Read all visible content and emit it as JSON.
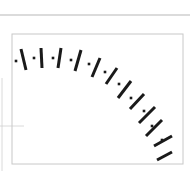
{
  "colors": {
    "background": "#ffffff",
    "tick": "#1a1a1a",
    "frame": "#c8c8c8",
    "top_rule": "#b8b8b8",
    "left_rule": "#d0d0d0"
  },
  "diagram": {
    "top_rule": {
      "x1": 0,
      "y1": 15,
      "x2": 190,
      "y2": 15
    },
    "frame": {
      "x": 12,
      "y": 34,
      "width": 171,
      "height": 130
    },
    "left_rules": [
      {
        "x1": 2,
        "y1": 78,
        "x2": 2,
        "y2": 171
      },
      {
        "x1": 0,
        "y1": 126,
        "x2": 24,
        "y2": 126
      }
    ],
    "dots": [
      [
        16,
        61
      ],
      [
        34,
        58
      ],
      [
        53,
        58
      ],
      [
        71,
        60
      ],
      [
        89,
        64
      ],
      [
        105,
        72
      ],
      [
        119,
        84
      ],
      [
        131,
        98
      ],
      [
        144,
        111
      ],
      [
        152,
        126
      ],
      [
        162,
        140
      ]
    ],
    "ticks": [
      [
        21,
        49,
        26,
        70
      ],
      [
        41,
        48,
        42,
        68
      ],
      [
        61,
        48,
        58,
        68
      ],
      [
        81,
        50,
        75,
        71
      ],
      [
        100,
        58,
        92,
        77
      ],
      [
        117,
        68,
        106,
        84
      ],
      [
        131,
        81,
        118,
        98
      ],
      [
        144,
        94,
        130,
        109
      ],
      [
        155,
        107,
        139,
        123
      ],
      [
        162,
        120,
        146,
        136
      ],
      [
        172,
        136,
        154,
        146
      ],
      [
        172,
        152,
        157,
        160
      ]
    ]
  }
}
